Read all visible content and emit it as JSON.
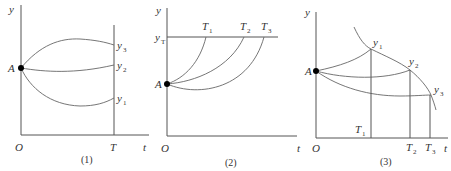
{
  "panels": [
    {
      "caption": "(1)",
      "axis": {
        "x_label": "t",
        "y_label": "y",
        "origin": "O"
      },
      "start_point": "A",
      "vertical_marker": "T",
      "curve_labels": [
        {
          "base": "y",
          "sub": "3"
        },
        {
          "base": "y",
          "sub": "2"
        },
        {
          "base": "y",
          "sub": "1"
        }
      ]
    },
    {
      "caption": "(2)",
      "axis": {
        "x_label": "t",
        "y_label": "y",
        "origin": "O"
      },
      "start_point": "A",
      "target_line": {
        "base": "y",
        "sub": "T"
      },
      "curve_labels": [
        {
          "base": "T",
          "sub": "1"
        },
        {
          "base": "T",
          "sub": "2"
        },
        {
          "base": "T",
          "sub": "3"
        }
      ]
    },
    {
      "caption": "(3)",
      "axis": {
        "x_label": "t",
        "y_label": "y",
        "origin": "O"
      },
      "start_point": "A",
      "curve_labels": [
        {
          "base": "y",
          "sub": "1"
        },
        {
          "base": "y",
          "sub": "2"
        },
        {
          "base": "y",
          "sub": "3"
        }
      ],
      "time_labels": [
        {
          "base": "T",
          "sub": "1"
        },
        {
          "base": "T",
          "sub": "2"
        },
        {
          "base": "T",
          "sub": "3"
        }
      ]
    }
  ]
}
